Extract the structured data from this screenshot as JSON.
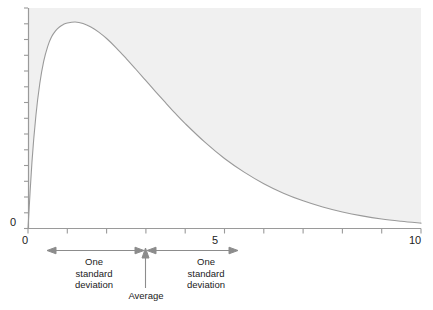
{
  "chart_data": {
    "type": "area",
    "title": "",
    "subtitle": "",
    "xlabel": "",
    "ylabel": "",
    "xlim": [
      0,
      10
    ],
    "ylim": [
      0,
      1
    ],
    "grid": false,
    "legend": null,
    "x_ticks": [
      0,
      1,
      2,
      3,
      4,
      5,
      6,
      7,
      8,
      9,
      10
    ],
    "x_tick_labels": [
      "0",
      "",
      "",
      "",
      "",
      "5",
      "",
      "",
      "",
      "",
      "10"
    ],
    "y_ticks": [
      0
    ],
    "y_tick_labels": [
      "0"
    ],
    "y_minor_tick_count": 14,
    "series": [
      {
        "name": "probability density",
        "x": [
          0.0,
          0.1,
          0.2,
          0.3,
          0.4,
          0.5,
          0.6,
          0.7,
          0.8,
          0.9,
          1.0,
          1.2,
          1.4,
          1.6,
          1.8,
          2.0,
          2.25,
          2.5,
          2.75,
          3.0,
          3.25,
          3.5,
          3.75,
          4.0,
          4.5,
          5.0,
          5.5,
          6.0,
          6.5,
          7.0,
          7.5,
          8.0,
          8.5,
          9.0,
          9.5,
          10.0
        ],
        "y": [
          0.0,
          0.32,
          0.545,
          0.702,
          0.81,
          0.881,
          0.928,
          0.957,
          0.976,
          0.988,
          0.995,
          1.0,
          0.993,
          0.976,
          0.951,
          0.92,
          0.874,
          0.823,
          0.77,
          0.716,
          0.662,
          0.609,
          0.557,
          0.508,
          0.418,
          0.339,
          0.273,
          0.217,
          0.171,
          0.134,
          0.104,
          0.08,
          0.061,
          0.046,
          0.035,
          0.026
        ]
      }
    ],
    "shaded_region": {
      "description": "area above the density curve, inside the axes",
      "color": "#f0f0f0"
    },
    "curve_color": "#9a9a9a",
    "axis_color": "#9a9a9a",
    "annotations": [
      {
        "name": "one-standard-deviation-left",
        "text": "One standard deviation",
        "lines": [
          "One",
          "standard",
          "deviation"
        ],
        "arrow": "double-headed",
        "x_start": 1.0,
        "x_end": 3.0
      },
      {
        "name": "average-marker",
        "text": "Average",
        "lines": [
          "Average"
        ],
        "arrow": "up",
        "x": 3.0
      },
      {
        "name": "one-standard-deviation-right",
        "text": "One standard deviation",
        "lines": [
          "One",
          "standard",
          "deviation"
        ],
        "arrow": "double-headed",
        "x_start": 3.0,
        "x_end": 5.35
      }
    ]
  },
  "axis": {
    "y_zero_label": "0",
    "x_zero_label": "0",
    "x_mid_label": "5",
    "x_max_label": "10"
  },
  "annotations": {
    "sd_left": {
      "line1": "One",
      "line2": "standard",
      "line3": "deviation"
    },
    "sd_right": {
      "line1": "One",
      "line2": "standard",
      "line3": "deviation"
    },
    "average_label": "Average"
  },
  "colors": {
    "shade": "#f0f0f0",
    "curve": "#9a9a9a",
    "axis": "#9a9a9a",
    "annotation": "#8c8c8c",
    "text": "#222222",
    "background": "#ffffff"
  }
}
